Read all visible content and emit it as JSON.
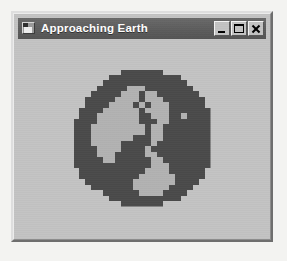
{
  "window": {
    "title": "Approaching Earth",
    "icon_name": "form-icon",
    "state": "inactive",
    "colors": {
      "titlebar": "#5c5c5c",
      "titlebar_text": "#ffffff",
      "face": "#c3c3c3",
      "desktop": "#f3f3f1",
      "border_light": "#dedede",
      "border_dark": "#6e6e6e"
    },
    "controls": [
      {
        "name": "minimize",
        "label": "_",
        "tooltip": "Minimize"
      },
      {
        "name": "maximize",
        "label": "□",
        "tooltip": "Maximize"
      },
      {
        "name": "close",
        "label": "×",
        "tooltip": "Close"
      }
    ]
  },
  "client": {
    "image": {
      "name": "earth-globe-bitmap",
      "alt": "Pixelated globe showing Earth with continents",
      "style": "pixelated low-resolution bitmap",
      "colors": {
        "ocean": "#4a4a4a",
        "land": "#b2b2b2",
        "shadow": "#3d3d3d",
        "background": "#c3c3c3"
      },
      "grid": 23,
      "pixels": [
        "00000000111111100000000",
        "00000011111111111100000",
        "00000111111111111110000",
        "00001111122211111111000",
        "00011111222122111111100",
        "00111112222122211111110",
        "00111122221212221111110",
        "01111222222122221111111",
        "01112222222112221121111",
        "11112222222111221111111",
        "11122222222212211111111",
        "11122222222212211111111",
        "11122222221112211111111",
        "11122222111112111111111",
        "11112222111121111111111",
        "11112221111122111111111",
        "11111221111112211111111",
        "11111111111112221111111",
        "01111111111122221111110",
        "01111111111222222111110",
        "00111111112222222111100",
        "00011111112222221111000",
        "00000111111222211110000",
        "00000011111111111100000",
        "00000000111111100000000"
      ]
    }
  }
}
